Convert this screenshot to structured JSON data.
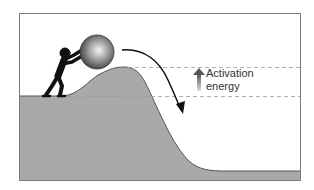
{
  "diagram": {
    "label_line1": "Activation",
    "label_line2": "energy",
    "colors": {
      "hill_fill": "#a9a9a9",
      "hill_stroke": "#555555",
      "frame": "#7a7a7a",
      "dash": "#9a9a9a",
      "figure": "#111111",
      "arrow_gradient_top": "#555555",
      "arrow_gradient_bottom": "#dddddd"
    },
    "elements": [
      "person-silhouette",
      "boulder",
      "hill",
      "curved-descent-arrow",
      "activation-energy-arrow",
      "dashed-reference-lines"
    ]
  }
}
